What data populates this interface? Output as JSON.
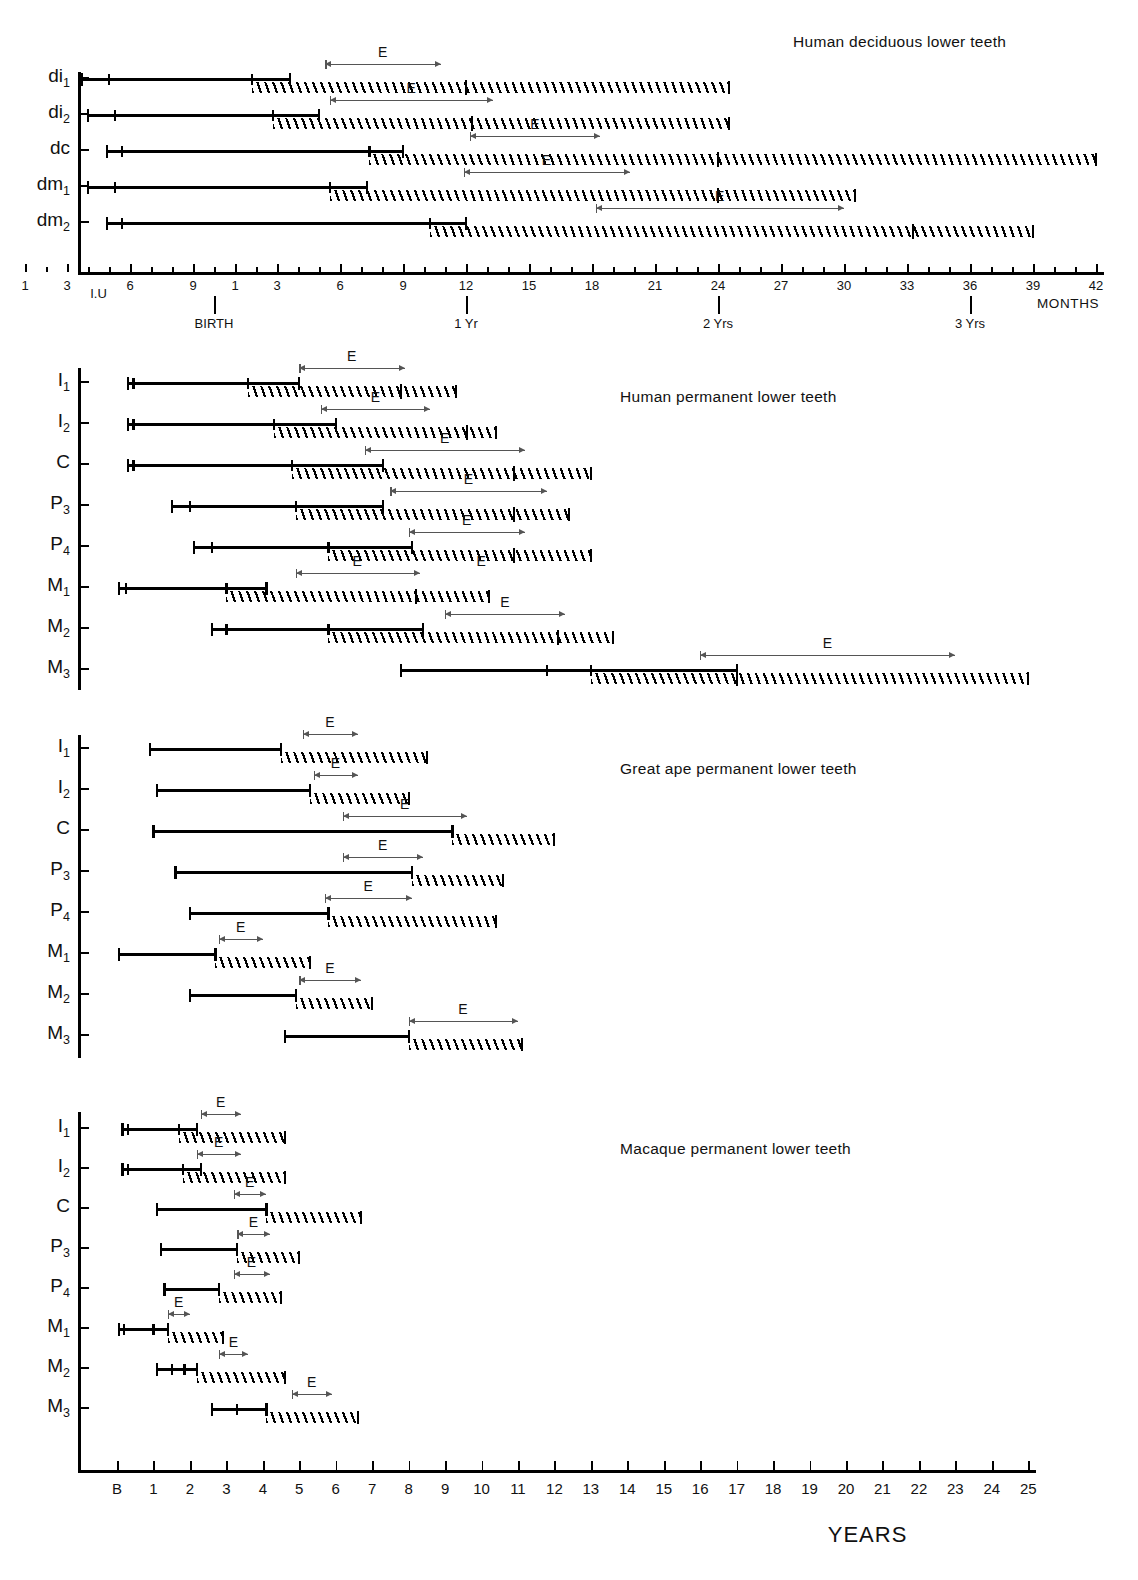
{
  "figure": {
    "units_label_months": "MONTHS",
    "units_label_years": "YEARS"
  },
  "chart_data": {
    "type": "bar",
    "xlabel": "Age",
    "ylabel": "Tooth",
    "grid": false,
    "legend": "E = emergence range",
    "panels": [
      {
        "id": "human-deciduous",
        "title": "Human deciduous lower teeth",
        "axis": {
          "unit": "MONTHS",
          "label": "MONTHS",
          "prenatal_ticks": [
            1,
            3,
            6,
            9
          ],
          "postnatal_ticks": [
            1,
            3,
            6,
            9,
            12,
            15,
            18,
            21,
            24,
            27,
            30,
            33,
            36,
            39,
            42
          ],
          "tick_labels": [
            "1",
            "3",
            "6",
            "9",
            "1",
            "3",
            "6",
            "9",
            "12",
            "15",
            "18",
            "21",
            "24",
            "27",
            "30",
            "33",
            "36",
            "39",
            "42"
          ],
          "annotations": [
            {
              "label": "I.U",
              "at_months": -5.5
            },
            {
              "label": "BIRTH",
              "at_months": 0
            },
            {
              "label": "1 Yr",
              "at_months": 12
            },
            {
              "label": "2 Yrs",
              "at_months": 24
            },
            {
              "label": "3 Yrs",
              "at_months": 36
            }
          ],
          "xlim_months": [
            -10,
            42
          ]
        },
        "rows": [
          {
            "tooth": "di",
            "sub": "1",
            "formation_start": -6.3,
            "formation_end": 3.6,
            "formation_ticks": [
              -5.0,
              1.8
            ],
            "hatch_start": 1.8,
            "hatch_end": 24.5,
            "hatch_marks": [
              12.0
            ],
            "emergence_start": 5.3,
            "emergence_end": 10.8,
            "emergence_label": "E"
          },
          {
            "tooth": "di",
            "sub": "2",
            "formation_start": -6.0,
            "formation_end": 5.0,
            "formation_ticks": [
              -4.7,
              2.8
            ],
            "hatch_start": 2.8,
            "hatch_end": 24.5,
            "hatch_marks": [
              12.3
            ],
            "emergence_start": 5.5,
            "emergence_end": 13.3,
            "emergence_label": "E"
          },
          {
            "tooth": "dc",
            "sub": "",
            "formation_start": -5.1,
            "formation_end": 9.0,
            "formation_ticks": [
              -4.4,
              7.4
            ],
            "hatch_start": 7.4,
            "hatch_end": 42.0,
            "hatch_marks": [
              24.0
            ],
            "emergence_start": 12.2,
            "emergence_end": 18.4,
            "emergence_label": "E"
          },
          {
            "tooth": "dm",
            "sub": "1",
            "formation_start": -6.0,
            "formation_end": 7.3,
            "formation_ticks": [
              -4.7,
              5.5
            ],
            "hatch_start": 5.5,
            "hatch_end": 30.5,
            "hatch_marks": [
              24.0
            ],
            "emergence_start": 11.9,
            "emergence_end": 19.8,
            "emergence_label": "E"
          },
          {
            "tooth": "dm",
            "sub": "2",
            "formation_start": -5.1,
            "formation_end": 12.0,
            "formation_ticks": [
              -4.4,
              10.3
            ],
            "hatch_start": 10.3,
            "hatch_end": 39.0,
            "hatch_marks": [
              33.3
            ],
            "emergence_start": 18.2,
            "emergence_end": 30.0,
            "emergence_label": "E"
          }
        ]
      },
      {
        "id": "human-permanent",
        "title": "Human permanent lower teeth",
        "axis": {
          "unit": "YEARS",
          "xlim_years": [
            0,
            25
          ]
        },
        "rows": [
          {
            "tooth": "I",
            "sub": "1",
            "formation_start": 0.3,
            "formation_end": 5.0,
            "formation_ticks": [
              0.45,
              3.6
            ],
            "hatch_start": 3.6,
            "hatch_end": 9.3,
            "hatch_marks": [
              7.8
            ],
            "emergence_start": 5.0,
            "emergence_end": 7.9,
            "emergence_label": "E"
          },
          {
            "tooth": "I",
            "sub": "2",
            "formation_start": 0.3,
            "formation_end": 6.0,
            "formation_ticks": [
              0.45,
              4.3
            ],
            "hatch_start": 4.3,
            "hatch_end": 10.4,
            "hatch_marks": [
              9.6
            ],
            "emergence_start": 5.6,
            "emergence_end": 8.6,
            "emergence_label": "E"
          },
          {
            "tooth": "C",
            "sub": "",
            "formation_start": 0.3,
            "formation_end": 7.3,
            "formation_ticks": [
              0.45,
              4.8
            ],
            "hatch_start": 4.8,
            "hatch_end": 13.0,
            "hatch_marks": [
              10.9
            ],
            "emergence_start": 6.8,
            "emergence_end": 11.2,
            "emergence_label": "E"
          },
          {
            "tooth": "P",
            "sub": "3",
            "formation_start": 1.5,
            "formation_end": 7.3,
            "formation_ticks": [
              2.0,
              4.9
            ],
            "hatch_start": 4.9,
            "hatch_end": 12.4,
            "hatch_marks": [
              10.9
            ],
            "emergence_start": 7.5,
            "emergence_end": 11.8,
            "emergence_label": "E"
          },
          {
            "tooth": "P",
            "sub": "4",
            "formation_start": 2.1,
            "formation_end": 8.1,
            "formation_ticks": [
              2.6,
              5.8
            ],
            "hatch_start": 5.8,
            "hatch_end": 13.0,
            "hatch_marks": [
              10.9
            ],
            "emergence_start": 8.0,
            "emergence_end": 11.2,
            "emergence_label": "E"
          },
          {
            "tooth": "M",
            "sub": "1",
            "formation_start": 0.05,
            "formation_end": 4.1,
            "formation_ticks": [
              0.25,
              3.0
            ],
            "hatch_start": 3.0,
            "hatch_end": 10.2,
            "hatch_marks": [
              8.2
            ],
            "emergence_start": 4.9,
            "emergence_end": 8.3,
            "emergence_label": "E",
            "extra_emergence_label": "E",
            "extra_emergence_at": 10.0
          },
          {
            "tooth": "M",
            "sub": "2",
            "formation_start": 2.6,
            "formation_end": 8.4,
            "formation_ticks": [
              3.0,
              5.8
            ],
            "hatch_start": 5.8,
            "hatch_end": 13.6,
            "hatch_marks": [
              12.1
            ],
            "emergence_start": 9.0,
            "emergence_end": 12.3,
            "emergence_label": "E"
          },
          {
            "tooth": "M",
            "sub": "3",
            "formation_start": 7.8,
            "formation_end": 17.0,
            "formation_ticks": [
              11.8,
              13.0
            ],
            "hatch_start": 13.0,
            "hatch_end": 25.0,
            "hatch_marks": [
              17.0
            ],
            "emergence_start": 16.0,
            "emergence_end": 23.0,
            "emergence_label": "E"
          }
        ]
      },
      {
        "id": "great-ape-permanent",
        "title": "Great ape permanent lower teeth",
        "axis": {
          "unit": "YEARS",
          "xlim_years": [
            0,
            25
          ]
        },
        "rows": [
          {
            "tooth": "I",
            "sub": "1",
            "formation_start": 0.9,
            "formation_end": 4.5,
            "formation_ticks": [],
            "hatch_start": 4.5,
            "hatch_end": 8.5,
            "hatch_marks": [],
            "emergence_start": 5.1,
            "emergence_end": 6.6,
            "emergence_label": "E"
          },
          {
            "tooth": "I",
            "sub": "2",
            "formation_start": 1.1,
            "formation_end": 5.3,
            "formation_ticks": [],
            "hatch_start": 5.3,
            "hatch_end": 8.0,
            "hatch_marks": [],
            "emergence_start": 5.4,
            "emergence_end": 6.6,
            "emergence_label": "E"
          },
          {
            "tooth": "C",
            "sub": "",
            "formation_start": 1.0,
            "formation_end": 9.2,
            "formation_ticks": [],
            "hatch_start": 9.2,
            "hatch_end": 12.0,
            "hatch_marks": [],
            "emergence_start": 6.2,
            "emergence_end": 9.6,
            "emergence_label": "E"
          },
          {
            "tooth": "P",
            "sub": "3",
            "formation_start": 1.6,
            "formation_end": 8.1,
            "formation_ticks": [],
            "hatch_start": 8.1,
            "hatch_end": 10.6,
            "hatch_marks": [],
            "emergence_start": 6.2,
            "emergence_end": 8.4,
            "emergence_label": "E"
          },
          {
            "tooth": "P",
            "sub": "4",
            "formation_start": 2.0,
            "formation_end": 5.8,
            "formation_ticks": [],
            "hatch_start": 5.8,
            "hatch_end": 10.4,
            "hatch_marks": [],
            "emergence_start": 5.7,
            "emergence_end": 8.1,
            "emergence_label": "E"
          },
          {
            "tooth": "M",
            "sub": "1",
            "formation_start": 0.05,
            "formation_end": 2.7,
            "formation_ticks": [],
            "hatch_start": 2.7,
            "hatch_end": 5.3,
            "hatch_marks": [],
            "emergence_start": 2.8,
            "emergence_end": 4.0,
            "emergence_label": "E"
          },
          {
            "tooth": "M",
            "sub": "2",
            "formation_start": 2.0,
            "formation_end": 4.9,
            "formation_ticks": [],
            "hatch_start": 4.9,
            "hatch_end": 7.0,
            "hatch_marks": [],
            "emergence_start": 5.0,
            "emergence_end": 6.7,
            "emergence_label": "E"
          },
          {
            "tooth": "M",
            "sub": "3",
            "formation_start": 4.6,
            "formation_end": 8.0,
            "formation_ticks": [],
            "hatch_start": 8.0,
            "hatch_end": 11.1,
            "hatch_marks": [],
            "emergence_start": 8.0,
            "emergence_end": 11.0,
            "emergence_label": "E"
          }
        ]
      },
      {
        "id": "macaque-permanent",
        "title": "Macaque permanent lower teeth",
        "axis": {
          "unit": "YEARS",
          "xlim_years": [
            0,
            25
          ]
        },
        "rows": [
          {
            "tooth": "I",
            "sub": "1",
            "formation_start": 0.15,
            "formation_end": 2.2,
            "formation_ticks": [
              0.3,
              1.7
            ],
            "hatch_start": 1.7,
            "hatch_end": 4.6,
            "hatch_marks": [],
            "emergence_start": 2.3,
            "emergence_end": 3.4,
            "emergence_label": "E"
          },
          {
            "tooth": "I",
            "sub": "2",
            "formation_start": 0.15,
            "formation_end": 2.3,
            "formation_ticks": [
              0.3,
              1.8
            ],
            "hatch_start": 1.8,
            "hatch_end": 4.6,
            "hatch_marks": [],
            "emergence_start": 2.2,
            "emergence_end": 3.4,
            "emergence_label": "E"
          },
          {
            "tooth": "C",
            "sub": "",
            "formation_start": 1.1,
            "formation_end": 4.1,
            "formation_ticks": [],
            "hatch_start": 4.1,
            "hatch_end": 6.7,
            "hatch_marks": [],
            "emergence_start": 3.2,
            "emergence_end": 4.1,
            "emergence_label": "E"
          },
          {
            "tooth": "P",
            "sub": "3",
            "formation_start": 1.2,
            "formation_end": 3.3,
            "formation_ticks": [],
            "hatch_start": 3.3,
            "hatch_end": 5.0,
            "hatch_marks": [],
            "emergence_start": 3.3,
            "emergence_end": 4.2,
            "emergence_label": "E"
          },
          {
            "tooth": "P",
            "sub": "4",
            "formation_start": 1.3,
            "formation_end": 2.8,
            "formation_ticks": [],
            "hatch_start": 2.8,
            "hatch_end": 4.5,
            "hatch_marks": [],
            "emergence_start": 3.2,
            "emergence_end": 4.2,
            "emergence_label": "E"
          },
          {
            "tooth": "M",
            "sub": "1",
            "formation_start": 0.05,
            "formation_end": 1.4,
            "formation_ticks": [
              0.2,
              1.0
            ],
            "hatch_start": 1.4,
            "hatch_end": 2.9,
            "hatch_marks": [],
            "emergence_start": 1.4,
            "emergence_end": 2.0,
            "emergence_label": "E"
          },
          {
            "tooth": "M",
            "sub": "2",
            "formation_start": 1.1,
            "formation_end": 2.2,
            "formation_ticks": [
              1.5,
              1.85
            ],
            "hatch_start": 2.2,
            "hatch_end": 4.6,
            "hatch_marks": [],
            "emergence_start": 2.8,
            "emergence_end": 3.6,
            "emergence_label": "E"
          },
          {
            "tooth": "M",
            "sub": "3",
            "formation_start": 2.6,
            "formation_end": 4.1,
            "formation_ticks": [
              3.3
            ],
            "hatch_start": 4.1,
            "hatch_end": 6.6,
            "hatch_marks": [],
            "emergence_start": 4.8,
            "emergence_end": 5.9,
            "emergence_label": "E"
          }
        ]
      }
    ],
    "years_axis": {
      "label": "YEARS",
      "ticks": [
        "B",
        "1",
        "2",
        "3",
        "4",
        "5",
        "6",
        "7",
        "8",
        "9",
        "10",
        "11",
        "12",
        "13",
        "14",
        "15",
        "16",
        "17",
        "18",
        "19",
        "20",
        "21",
        "22",
        "23",
        "24",
        "25"
      ]
    }
  }
}
